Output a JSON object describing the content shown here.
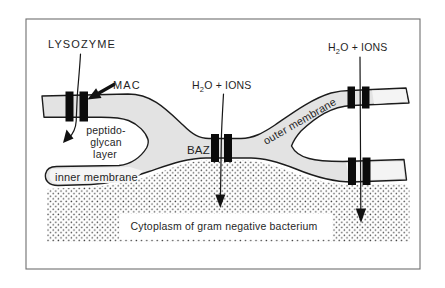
{
  "figure": {
    "labels": {
      "lysozyme": "LYSOZYME",
      "mac": "MAC",
      "h2o_left": {
        "h": "H",
        "sub": "2",
        "rest": "O + IONS"
      },
      "h2o_right": {
        "h": "H",
        "sub": "2",
        "rest": "O + IONS"
      },
      "peptidoglycan_line1": "peptido-",
      "peptidoglycan_line2": "glycan",
      "peptidoglycan_line3": "layer",
      "inner_membrane": "inner membrane",
      "outer_membrane": "outer membrane",
      "baz": "BAZ",
      "cytoplasm": "Cytoplasm of gram negative bacterium"
    },
    "colors": {
      "background": "#ffffff",
      "membrane_fill": "#e3e3e3",
      "membrane_light_fill": "#f4f4f4",
      "pore_bar": "#0b0b0b",
      "stipple_dot": "#474747",
      "frame_border": "#6f6f6f",
      "text": "#1f1f1f"
    }
  }
}
